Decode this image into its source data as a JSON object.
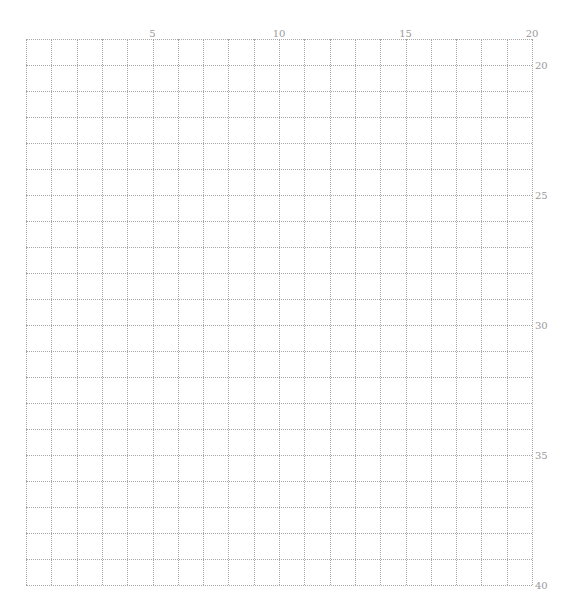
{
  "sheet": {
    "type": "manuscript-grid-paper",
    "columns": 20,
    "rows": 21,
    "line_color": "#a8a8a8",
    "label_color": "#9a9a9a",
    "column_labels": [
      {
        "col": 5,
        "text": "5"
      },
      {
        "col": 10,
        "text": "10"
      },
      {
        "col": 15,
        "text": "15"
      },
      {
        "col": 20,
        "text": "20"
      }
    ],
    "row_labels": [
      {
        "row": 1,
        "text": "20"
      },
      {
        "row": 6,
        "text": "25"
      },
      {
        "row": 11,
        "text": "30"
      },
      {
        "row": 16,
        "text": "35"
      },
      {
        "row": 21,
        "text": "40"
      }
    ]
  }
}
